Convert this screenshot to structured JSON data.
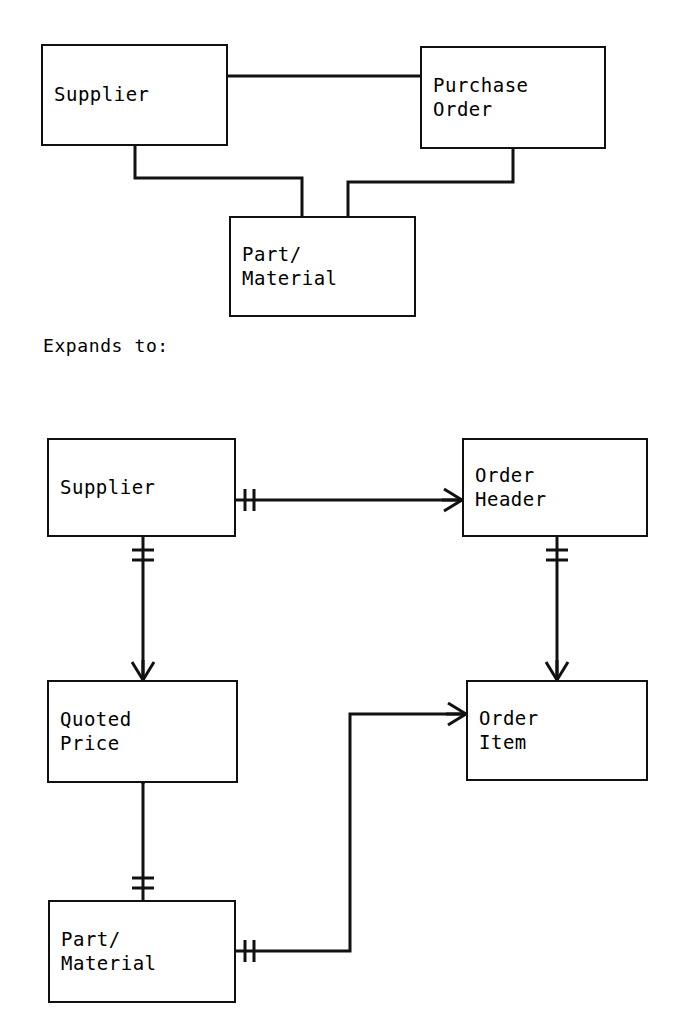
{
  "diagram": {
    "title_caption": "Expands to:",
    "notation": "crows-foot-ERD",
    "top_model": {
      "name": "high-level-model",
      "entities": [
        {
          "id": "supplier",
          "label": "Supplier",
          "x": 41,
          "y": 44,
          "w": 187,
          "h": 102
        },
        {
          "id": "purchase_order",
          "label": "Purchase\nOrder",
          "x": 420,
          "y": 46,
          "w": 186,
          "h": 103
        },
        {
          "id": "part_material",
          "label": "Part/\nMaterial",
          "x": 229,
          "y": 216,
          "w": 187,
          "h": 101
        }
      ],
      "relationships": [
        {
          "id": "supplier-purchase_order",
          "from": "supplier",
          "to": "purchase_order",
          "from_marker": "none",
          "to_marker": "none"
        },
        {
          "id": "supplier-part_material",
          "from": "supplier",
          "to": "part_material",
          "from_marker": "none",
          "to_marker": "none"
        },
        {
          "id": "purchase_order-part_material",
          "from": "purchase_order",
          "to": "part_material",
          "from_marker": "none",
          "to_marker": "none"
        }
      ]
    },
    "bottom_model": {
      "name": "expanded-model",
      "entities": [
        {
          "id": "supplier2",
          "label": "Supplier",
          "x": 47,
          "y": 438,
          "w": 189,
          "h": 99
        },
        {
          "id": "order_header",
          "label": "Order\nHeader",
          "x": 462,
          "y": 438,
          "w": 186,
          "h": 99
        },
        {
          "id": "quoted_price",
          "label": "Quoted\nPrice",
          "x": 47,
          "y": 680,
          "w": 191,
          "h": 103
        },
        {
          "id": "order_item",
          "label": "Order\nItem",
          "x": 466,
          "y": 680,
          "w": 182,
          "h": 101
        },
        {
          "id": "part_material2",
          "label": "Part/\nMaterial",
          "x": 48,
          "y": 900,
          "w": 188,
          "h": 103
        }
      ],
      "relationships": [
        {
          "id": "supplier2-order_header",
          "from": "supplier2",
          "to": "order_header",
          "from_marker": "one-and-only-one",
          "to_marker": "many"
        },
        {
          "id": "supplier2-quoted_price",
          "from": "supplier2",
          "to": "quoted_price",
          "from_marker": "one-and-only-one",
          "to_marker": "many"
        },
        {
          "id": "order_header-order_item",
          "from": "order_header",
          "to": "order_item",
          "from_marker": "one-and-only-one",
          "to_marker": "many"
        },
        {
          "id": "quoted_price-part_material2",
          "from": "quoted_price",
          "to": "part_material2",
          "from_marker": "many",
          "to_marker": "one-and-only-one"
        },
        {
          "id": "part_material2-order_item",
          "from": "part_material2",
          "to": "order_item",
          "from_marker": "one-and-only-one",
          "to_marker": "many"
        }
      ]
    },
    "colors": {
      "stroke": "#111111",
      "background": "#ffffff",
      "text": "#000000"
    }
  }
}
